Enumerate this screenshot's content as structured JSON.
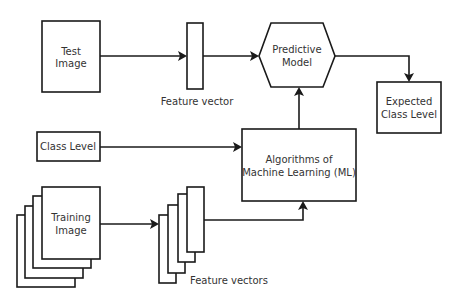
{
  "diagram": {
    "nodes": {
      "test_image": {
        "line1": "Test",
        "line2": "Image"
      },
      "feature_vector": {
        "label": "Feature vector"
      },
      "predictive_model": {
        "line1": "Predictive",
        "line2": "Model"
      },
      "expected_class_level": {
        "line1": "Expected",
        "line2": "Class Level"
      },
      "class_level": {
        "label": "Class Level"
      },
      "ml_algorithms": {
        "line1": "Algorithms of",
        "line2": "Machine Learning (ML)"
      },
      "training_image": {
        "line1": "Training",
        "line2": "Image"
      },
      "feature_vectors": {
        "label": "Feature vectors"
      }
    },
    "edges": [
      {
        "from": "Test Image",
        "to": "Feature vector"
      },
      {
        "from": "Feature vector",
        "to": "Predictive Model"
      },
      {
        "from": "Predictive Model",
        "to": "Expected Class Level"
      },
      {
        "from": "Class Level",
        "to": "Algorithms of Machine Learning (ML)"
      },
      {
        "from": "Training Image",
        "to": "Feature vectors"
      },
      {
        "from": "Feature vectors",
        "to": "Algorithms of Machine Learning (ML)"
      },
      {
        "from": "Algorithms of Machine Learning (ML)",
        "to": "Predictive Model"
      }
    ],
    "colors": {
      "stroke": "#1a1a1a",
      "text": "#333333",
      "background": "#ffffff"
    }
  }
}
